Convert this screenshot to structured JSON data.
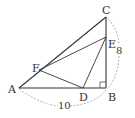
{
  "diagram": {
    "points": {
      "A": {
        "label": "A"
      },
      "B": {
        "label": "B"
      },
      "C": {
        "label": "C"
      },
      "D": {
        "label": "D"
      },
      "E": {
        "label": "E"
      },
      "F": {
        "label": "F"
      }
    },
    "dimensions": {
      "AB": "10",
      "BC": "8"
    },
    "right_angle_at": "B",
    "colors": {
      "line": "#333333",
      "dashed": "#999999"
    }
  }
}
